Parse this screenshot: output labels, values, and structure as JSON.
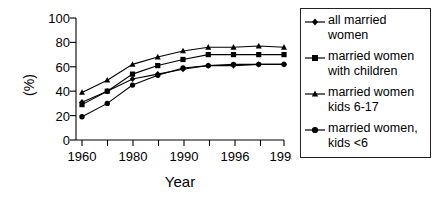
{
  "chart_data": {
    "type": "line",
    "title": "",
    "subtitle": "",
    "xlabel": "Year",
    "ylabel": "(%)",
    "xlim": [
      1958,
      1999
    ],
    "ylim": [
      0,
      100
    ],
    "ytick_values": [
      0,
      20,
      40,
      60,
      80,
      100
    ],
    "ytick_labels": [
      "0",
      "20",
      "40",
      "60",
      "80",
      "100"
    ],
    "xtick_values": [
      1960,
      1970,
      1980,
      1985,
      1990,
      1993,
      1996,
      1997,
      1998
    ],
    "xtick_labels": [
      "1960",
      "",
      "1980",
      "",
      "1990",
      "",
      "1996",
      "",
      "1998"
    ],
    "grid": false,
    "legend_position": "right",
    "x": [
      1960,
      1970,
      1980,
      1985,
      1990,
      1993,
      1996,
      1997,
      1998
    ],
    "series": [
      {
        "name": "all married women",
        "marker": "diamond",
        "values": [
          31,
          40,
          50,
          54,
          58,
          61,
          61,
          62,
          62
        ]
      },
      {
        "name": "married women with children",
        "marker": "square",
        "values": [
          29,
          40,
          54,
          61,
          66,
          70,
          70,
          70,
          70
        ]
      },
      {
        "name": "married women kids 6-17",
        "marker": "triangle",
        "values": [
          39,
          49,
          62,
          68,
          73,
          76,
          76,
          77,
          76
        ]
      },
      {
        "name": "married women, kids <6",
        "marker": "circle",
        "values": [
          19,
          30,
          45,
          53,
          59,
          61,
          62,
          62,
          62
        ]
      }
    ]
  },
  "legend": {
    "entries": [
      {
        "label": "all married\nwomen",
        "marker": "diamond"
      },
      {
        "label": "married women\nwith children",
        "marker": "square"
      },
      {
        "label": "married women\nkids 6-17",
        "marker": "triangle"
      },
      {
        "label": "married women,\nkids <6",
        "marker": "circle"
      }
    ]
  },
  "colors": {
    "line": "#000000",
    "marker": "#000000",
    "axis": "#000000",
    "background": "#ffffff",
    "legend_border": "#222222"
  }
}
